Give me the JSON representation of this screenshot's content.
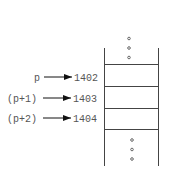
{
  "diagram": {
    "type": "memory-layout",
    "pointers": [
      {
        "label": "p",
        "address": "1402"
      },
      {
        "label": "(p+1)",
        "address": "1403"
      },
      {
        "label": "(p+2)",
        "address": "1404"
      }
    ],
    "continuation_symbol": "ellipsis-vertical"
  }
}
